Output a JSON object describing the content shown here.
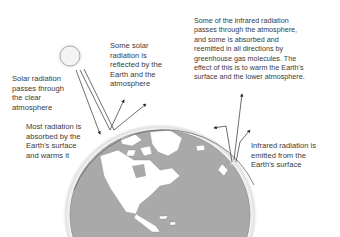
{
  "diagram": {
    "labels": {
      "solar_passes": "Solar radiation\npasses through\nthe clear\natmosphere",
      "solar_reflected": "Some solar\nradiation is\nreflected by the\nEarth and the\natmosphere",
      "absorbed": "Most radiation is\nabsorbed by the\nEarth's surface\nand warms it",
      "infrared_passes": "Some of the infrared radiation\npasses through the atmosphere,\nand some is absorbed and\nreemitted in all directions by\ngreenhouse gas molecules. The\neffect of this is to warm the Earth's\nsurface and the lower atmosphere.",
      "infrared_emitted": "Infrared radiation is\nemitted from the\nEarth's surface"
    },
    "elements": {
      "sun": "sun",
      "earth": "earth-globe-north-america",
      "atmosphere": "atmosphere-layer"
    },
    "colors": {
      "land": "#ffffff",
      "ocean": "#a9a9a9",
      "atmosphere_line": "#6a6a6a",
      "arrow": "#2e2e2e",
      "text": "#3a3a3a",
      "sun_fill": "#f3f3f3",
      "sun_glow": "#d9d9d9"
    }
  }
}
